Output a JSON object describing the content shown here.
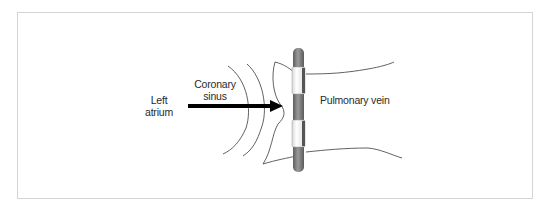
{
  "diagram": {
    "type": "anatomical-schematic",
    "labels": {
      "left_atrium": [
        "Left",
        "atrium"
      ],
      "coronary_sinus": [
        "Coronary",
        "sinus"
      ],
      "pulmonary_vein": "Pulmonary vein"
    },
    "elements": {
      "arrow": {
        "from": [
          188,
          106
        ],
        "to": [
          282,
          106
        ],
        "color": "#000000"
      },
      "catheter": {
        "x": 298,
        "top": 48,
        "bottom": 172,
        "color": "#7a7a7a",
        "electrodes": 2
      }
    },
    "colors": {
      "frame_border": "#d4d4d4",
      "line": "#3a3a3a",
      "text": "#2a2a2a",
      "catheter_shaft": "#7a7a7a",
      "electrode": "#f2f2f2"
    }
  }
}
